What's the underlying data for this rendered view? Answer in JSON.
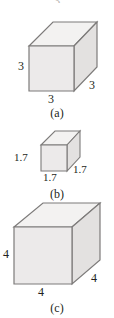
{
  "figure": {
    "type": "geometry-diagram",
    "background_color": "#ffffff",
    "ink_color": "#231f20",
    "face_colors": {
      "front": "#eceaea",
      "top": "#f3f2f1",
      "side": "#e3e1e0",
      "edge": "#7d7b7a"
    },
    "clipped_top_glyph": "3"
  },
  "panels": [
    {
      "id": "a",
      "caption": "(a)",
      "edge_length": 3,
      "labels": {
        "left": "3",
        "bottom": "3",
        "right": "3"
      }
    },
    {
      "id": "b",
      "caption": "(b)",
      "edge_length": 1.7,
      "labels": {
        "left": "1.7",
        "bottom": "1.7",
        "right": "1.7"
      }
    },
    {
      "id": "c",
      "caption": "(c)",
      "edge_length": 4,
      "labels": {
        "left": "4",
        "bottom": "4",
        "right": "4"
      }
    }
  ]
}
